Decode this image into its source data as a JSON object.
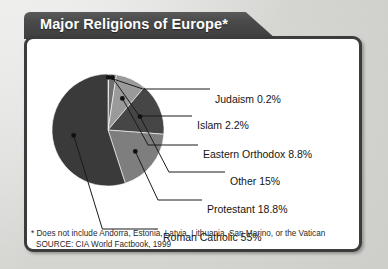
{
  "title": {
    "text": "Major Religions of Europe*"
  },
  "chart_data": {
    "type": "pie",
    "title": "Major Religions of Europe*",
    "legend_position": "callout-labels-right",
    "start_angle_deg": 0,
    "direction": "clockwise",
    "categories": [
      "Judaism",
      "Islam",
      "Eastern Orthodox",
      "Other",
      "Protestant",
      "Roman Catholic"
    ],
    "values": [
      0.2,
      2.2,
      8.8,
      15,
      18.8,
      55
    ],
    "value_unit": "percent",
    "slices": [
      {
        "label": "Judaism 0.2%",
        "name": "Judaism",
        "value": 0.2,
        "color": "#8e8e8e"
      },
      {
        "label": "Islam 2.2%",
        "name": "Islam",
        "value": 2.2,
        "color": "#6f6f6f"
      },
      {
        "label": "Eastern Orthodox 8.8%",
        "name": "Eastern Orthodox",
        "value": 8.8,
        "color": "#9a9a9a"
      },
      {
        "label": "Other 15%",
        "name": "Other",
        "value": 15,
        "color": "#464646"
      },
      {
        "label": "Protestant 18.8%",
        "name": "Protestant",
        "value": 18.8,
        "color": "#7e7e7e"
      },
      {
        "label": "Roman Catholic 55%",
        "name": "Roman Catholic",
        "value": 55,
        "color": "#3a3a3a"
      }
    ]
  },
  "labels": {
    "judaism": "Judaism 0.2%",
    "islam": "Islam 2.2%",
    "eastern_orthodox": "Eastern Orthodox 8.8%",
    "other": "Other 15%",
    "protestant": "Protestant 18.8%",
    "roman_catholic": "Roman Catholic 55%"
  },
  "footnotes": {
    "disclaimer": "* Does not include Andorra, Estonia, Latvia, Lithuania, San Marino, or the Vatican",
    "source": "SOURCE: CIA World Factbook, 1999"
  },
  "colors": {
    "page_background": "#d9d9d7",
    "title_bar": "#4a4a4a",
    "title_text": "#ffffff",
    "panel_background": "#ffffff",
    "panel_border": "#3c3c3c",
    "label_text": "#151515",
    "leader_line": "#1a1a1a"
  }
}
